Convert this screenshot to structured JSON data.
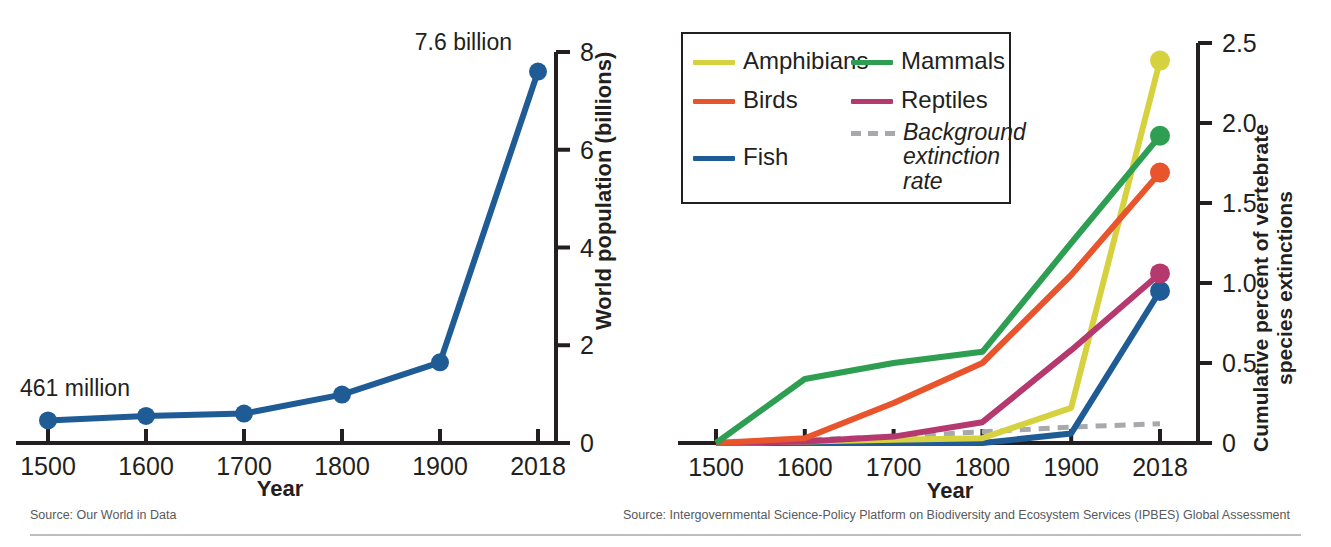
{
  "chart_data": [
    {
      "id": "world-population",
      "type": "line",
      "title": "",
      "xlabel": "Year",
      "ylabel": "World population (billions)",
      "categories": [
        "1500",
        "1600",
        "1700",
        "1800",
        "1900",
        "2018"
      ],
      "x": [
        1500,
        1600,
        1700,
        1800,
        1900,
        2018
      ],
      "ylim": [
        0,
        8
      ],
      "yticks": [
        "0",
        "2",
        "4",
        "6",
        "8"
      ],
      "ytick_values": [
        0,
        2,
        4,
        6,
        8
      ],
      "grid": false,
      "legend": "none",
      "y_axis_position": "right",
      "series": [
        {
          "name": "World population",
          "color": "#1f5c96",
          "values": [
            0.461,
            0.554,
            0.603,
            0.99,
            1.65,
            7.6
          ],
          "markers": true
        }
      ],
      "annotations": [
        {
          "text": "461 million",
          "x": 1500,
          "y": 0.461,
          "position": "above-right"
        },
        {
          "text": "7.6 billion",
          "x": 2018,
          "y": 7.6,
          "position": "above-left"
        }
      ],
      "source": "Source: Our World in Data"
    },
    {
      "id": "vertebrate-extinctions",
      "type": "line",
      "title": "",
      "xlabel": "Year",
      "ylabel": "Cumulative percent of vertebrate species extinctions",
      "ylabel_line1": "Cumulative percent of vertebrate",
      "ylabel_line2": "species extinctions",
      "categories": [
        "1500",
        "1600",
        "1700",
        "1800",
        "1900",
        "2018"
      ],
      "x": [
        1500,
        1600,
        1700,
        1800,
        1900,
        2018
      ],
      "ylim": [
        0,
        2.5
      ],
      "yticks": [
        "0",
        "0.5",
        "1.0",
        "1.5",
        "2.0",
        "2.5"
      ],
      "ytick_values": [
        0,
        0.5,
        1.0,
        1.5,
        2.0,
        2.5
      ],
      "grid": false,
      "legend": "top-left",
      "y_axis_position": "right",
      "series": [
        {
          "name": "Amphibians",
          "color": "#d6d23f",
          "dash": false,
          "endpoint_marker": true,
          "values": [
            0.0,
            0.01,
            0.02,
            0.03,
            0.22,
            2.39
          ]
        },
        {
          "name": "Birds",
          "color": "#e8542b",
          "dash": false,
          "endpoint_marker": true,
          "values": [
            0.0,
            0.03,
            0.25,
            0.5,
            1.05,
            1.69
          ]
        },
        {
          "name": "Fish",
          "color": "#1f5c96",
          "dash": false,
          "endpoint_marker": true,
          "values": [
            0.0,
            0.0,
            0.0,
            0.0,
            0.06,
            0.95
          ]
        },
        {
          "name": "Mammals",
          "color": "#2e9e52",
          "dash": false,
          "endpoint_marker": true,
          "values": [
            0.0,
            0.4,
            0.5,
            0.57,
            1.25,
            1.92
          ]
        },
        {
          "name": "Reptiles",
          "color": "#b5386e",
          "dash": false,
          "endpoint_marker": true,
          "values": [
            0.0,
            0.01,
            0.04,
            0.13,
            0.58,
            1.06
          ]
        },
        {
          "name": "Background extinction rate",
          "color": "#a7a9ac",
          "dash": true,
          "endpoint_marker": false,
          "values": [
            0.0,
            0.02,
            0.04,
            0.07,
            0.1,
            0.12
          ]
        }
      ],
      "source": "Source: Intergovernmental Science-Policy Platform on Biodiversity and Ecosystem Services (IPBES) Global Assessment"
    }
  ],
  "left_panel": {
    "xaxis_title": "Year",
    "yaxis_title": "World population (billions)",
    "xticks": [
      "1500",
      "1600",
      "1700",
      "1800",
      "1900",
      "2018"
    ],
    "yticks": [
      "0",
      "2",
      "4",
      "6",
      "8"
    ],
    "annotation_start": "461 million",
    "annotation_end": "7.6 billion",
    "source": "Source: Our World in Data"
  },
  "right_panel": {
    "xaxis_title": "Year",
    "yaxis_title_line1": "Cumulative percent of vertebrate",
    "yaxis_title_line2": "species extinctions",
    "xticks": [
      "1500",
      "1600",
      "1700",
      "1800",
      "1900",
      "2018"
    ],
    "yticks": [
      "0",
      "0.5",
      "1.0",
      "1.5",
      "2.0",
      "2.5"
    ],
    "source": "Source: Intergovernmental Science-Policy Platform on Biodiversity and Ecosystem Services (IPBES) Global Assessment",
    "legend": [
      {
        "label": "Amphibians",
        "color": "#d6d23f",
        "dashed": false
      },
      {
        "label": "Mammals",
        "color": "#2e9e52",
        "dashed": false
      },
      {
        "label": "Birds",
        "color": "#e8542b",
        "dashed": false
      },
      {
        "label": "Reptiles",
        "color": "#b5386e",
        "dashed": false
      },
      {
        "label": "Fish",
        "color": "#1f5c96",
        "dashed": false
      },
      {
        "label": "Background extinction rate",
        "color": "#a7a9ac",
        "dashed": true
      }
    ]
  },
  "colors": {
    "axis": "#231f20",
    "amphibians": "#d6d23f",
    "birds": "#e8542b",
    "fish": "#1f5c96",
    "mammals": "#2e9e52",
    "reptiles": "#b5386e",
    "background_rate": "#a7a9ac",
    "population_line": "#1f5c96",
    "source_text": "#58595b"
  }
}
